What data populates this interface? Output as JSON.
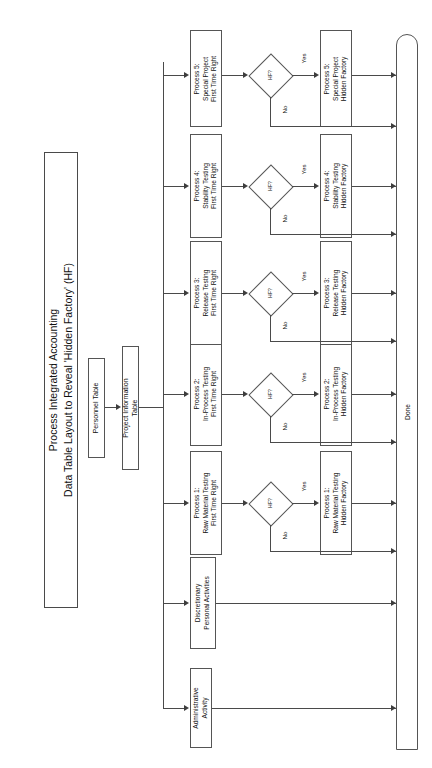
{
  "title": {
    "line1": "Process Integrated Accounting",
    "line2": "Data Table Layout to Reveal 'Hidden Factory' (HF)"
  },
  "tables": [
    {
      "id": "personnel-table",
      "label": "Personnel Table"
    },
    {
      "id": "project-information-table",
      "label": "Project Information\nTable"
    }
  ],
  "decision": {
    "label": "HF?",
    "yes": "Yes",
    "no": "No"
  },
  "terminator": {
    "label": "Done"
  },
  "activities": [
    {
      "id": "administrative-activity",
      "label": "Administrative\nActivity",
      "has_decision": false
    },
    {
      "id": "discretionary-personal-activities",
      "label": "Discretionary\nPersonal Activities",
      "has_decision": false
    }
  ],
  "processes": [
    {
      "id": "process-1",
      "ftr_label": "Process 1:\nRaw Material Testing\nFirst Time Right",
      "hf_label": "Process 1:\nRaw Material Testing\nHidden Factory"
    },
    {
      "id": "process-2",
      "ftr_label": "Process 2:\nIn-Process Testing\nFirst Time Right",
      "hf_label": "Process 2:\nIn-Process Testing\nHidden Factory"
    },
    {
      "id": "process-3",
      "ftr_label": "Process 3:\nRelease Testing\nFirst Time Right",
      "hf_label": "Process 3:\nRelease Testing\nHidden Factory"
    },
    {
      "id": "process-4",
      "ftr_label": "Process 4:\nStability Testing\nFirst Time Right",
      "hf_label": "Process 4:\nStability Testing\nHidden Factory"
    },
    {
      "id": "process-5",
      "ftr_label": "Process 5:\nSpecial Project\nFirst Time Right",
      "hf_label": "Process 5:\nSpecial Project\nHidden Factory"
    }
  ],
  "colors": {
    "stroke": "#4a4a4a",
    "box_border": "#555555",
    "text": "#111111",
    "background": "#ffffff"
  }
}
